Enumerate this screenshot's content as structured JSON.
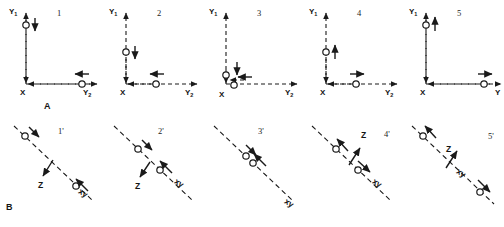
{
  "figure": {
    "background": "#ffffff",
    "stroke_color": "#1a1a1a",
    "rows": [
      {
        "id": "A",
        "label": "A",
        "axis_labels": {
          "vertical": "Y",
          "vertical_sub": "1",
          "horizontal": "Y",
          "horizontal_sub": "2",
          "origin": "X"
        },
        "panels": [
          {
            "number": "1",
            "vertical_marker_pos": 0.12,
            "vertical_arrow": "down",
            "horizontal_marker_pos": 0.86,
            "horizontal_arrow": "left"
          },
          {
            "number": "2",
            "vertical_marker_pos": 0.46,
            "vertical_arrow": "down",
            "horizontal_marker_pos": 0.5,
            "horizontal_arrow": "left"
          },
          {
            "number": "3",
            "vertical_marker_pos": 0.86,
            "vertical_arrow": "down",
            "horizontal_marker_pos": 0.12,
            "horizontal_arrow": "left"
          },
          {
            "number": "4",
            "vertical_marker_pos": 0.46,
            "vertical_arrow": "up",
            "horizontal_marker_pos": 0.5,
            "horizontal_arrow": "right"
          },
          {
            "number": "5",
            "vertical_marker_pos": 0.12,
            "vertical_arrow": "up",
            "horizontal_marker_pos": 0.86,
            "horizontal_arrow": "right"
          }
        ]
      },
      {
        "id": "B",
        "label": "B",
        "axis_labels": {
          "diagonal": "xy",
          "normal": "Z"
        },
        "panels": [
          {
            "number": "1'",
            "upper_marker_pos": 0.12,
            "upper_arrow": "toward",
            "lower_marker_pos": 0.86,
            "lower_arrow": "toward",
            "z_label": "Z",
            "z_arrow": "down",
            "xy_label": "xy"
          },
          {
            "number": "2'",
            "upper_marker_pos": 0.3,
            "upper_arrow": "toward",
            "lower_marker_pos": 0.58,
            "lower_arrow": "toward",
            "z_label": "Z",
            "z_arrow": "down",
            "xy_label": "xy"
          },
          {
            "number": "3'",
            "upper_marker_pos": 0.44,
            "upper_arrow": "toward",
            "lower_marker_pos": 0.52,
            "lower_arrow": "toward",
            "z_label": "",
            "z_arrow": "none",
            "xy_label": "xy"
          },
          {
            "number": "4'",
            "upper_marker_pos": 0.3,
            "upper_arrow": "away",
            "lower_marker_pos": 0.58,
            "lower_arrow": "away",
            "z_label": "Z",
            "z_arrow": "up",
            "xy_label": "xy"
          },
          {
            "number": "5'",
            "upper_marker_pos": 0.12,
            "upper_arrow": "away",
            "lower_marker_pos": 0.86,
            "lower_arrow": "away",
            "z_label": "Z",
            "z_arrow": "up",
            "xy_label": "xy"
          }
        ]
      }
    ]
  }
}
